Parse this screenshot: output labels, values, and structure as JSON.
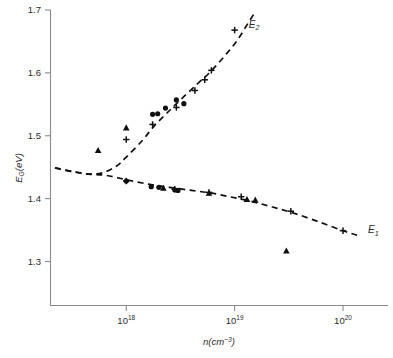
{
  "chart_data": {
    "type": "scatter",
    "title": "",
    "xlabel": "n(cm−3)",
    "xlabel_base": "n(cm",
    "xlabel_exp": "−3",
    "xlabel_close": ")",
    "ylabel": "E_G(eV)",
    "ylabel_base": "E",
    "ylabel_sub": "G",
    "ylabel_unit": "(eV)",
    "xscale": "log",
    "yscale": "linear",
    "xlim": [
      2e+17,
      2.6e+20
    ],
    "ylim": [
      1.23,
      1.7
    ],
    "grid": false,
    "legend_position": "inline-annotation",
    "xticks": [
      {
        "value": 1e+18,
        "label": "10",
        "exponent": "18"
      },
      {
        "value": 1e+19,
        "label": "10",
        "exponent": "19"
      },
      {
        "value": 1e+20,
        "label": "10",
        "exponent": "20"
      }
    ],
    "yticks": [
      {
        "value": 1.7,
        "label": "1.7"
      },
      {
        "value": 1.6,
        "label": "1.6"
      },
      {
        "value": 1.5,
        "label": "1.5"
      },
      {
        "value": 1.4,
        "label": "1.4"
      },
      {
        "value": 1.3,
        "label": "1.3"
      }
    ],
    "annotations": [
      {
        "text": "E",
        "sub": "2",
        "x": 1.35e+19,
        "y": 1.672,
        "name": "curve-label-e2"
      },
      {
        "text": "E",
        "sub": "1",
        "x": 1.7e+20,
        "y": 1.345,
        "name": "curve-label-e1"
      }
    ],
    "series": [
      {
        "name": "E2",
        "kind": "fit-curve",
        "style": "dashed",
        "points": [
          {
            "x": 2.2e+17,
            "y": 1.449
          },
          {
            "x": 3.2e+17,
            "y": 1.443
          },
          {
            "x": 4.5e+17,
            "y": 1.439
          },
          {
            "x": 6e+17,
            "y": 1.441
          },
          {
            "x": 8e+17,
            "y": 1.451
          },
          {
            "x": 1e+18,
            "y": 1.466
          },
          {
            "x": 1.4e+18,
            "y": 1.492
          },
          {
            "x": 1.8e+18,
            "y": 1.515
          },
          {
            "x": 2.4e+18,
            "y": 1.537
          },
          {
            "x": 3.2e+18,
            "y": 1.558
          },
          {
            "x": 4.5e+18,
            "y": 1.582
          },
          {
            "x": 6e+18,
            "y": 1.602
          },
          {
            "x": 8e+18,
            "y": 1.626
          },
          {
            "x": 1.05e+19,
            "y": 1.651
          },
          {
            "x": 1.35e+19,
            "y": 1.681
          },
          {
            "x": 1.55e+19,
            "y": 1.697
          }
        ]
      },
      {
        "name": "E1",
        "kind": "fit-curve",
        "style": "dashed",
        "points": [
          {
            "x": 2.2e+17,
            "y": 1.449
          },
          {
            "x": 3.2e+17,
            "y": 1.443
          },
          {
            "x": 4.5e+17,
            "y": 1.439
          },
          {
            "x": 6.5e+17,
            "y": 1.437
          },
          {
            "x": 1e+18,
            "y": 1.43
          },
          {
            "x": 1.6e+18,
            "y": 1.423
          },
          {
            "x": 2.5e+18,
            "y": 1.418
          },
          {
            "x": 4e+18,
            "y": 1.413
          },
          {
            "x": 6e+18,
            "y": 1.409
          },
          {
            "x": 9e+18,
            "y": 1.403
          },
          {
            "x": 1.4e+19,
            "y": 1.396
          },
          {
            "x": 2.2e+19,
            "y": 1.387
          },
          {
            "x": 3.5e+19,
            "y": 1.377
          },
          {
            "x": 6e+19,
            "y": 1.363
          },
          {
            "x": 1e+20,
            "y": 1.349
          },
          {
            "x": 1.45e+20,
            "y": 1.34
          }
        ]
      },
      {
        "name": "E2 data (circles)",
        "kind": "scatter",
        "marker": "circle",
        "points": [
          {
            "x": 1.75e+18,
            "y": 1.534
          },
          {
            "x": 1.95e+18,
            "y": 1.535
          },
          {
            "x": 2.3e+18,
            "y": 1.544
          },
          {
            "x": 2.9e+18,
            "y": 1.557
          },
          {
            "x": 3.4e+18,
            "y": 1.551
          }
        ]
      },
      {
        "name": "E2 data (triangles)",
        "kind": "scatter",
        "marker": "triangle",
        "points": [
          {
            "x": 5.5e+17,
            "y": 1.477
          },
          {
            "x": 1e+18,
            "y": 1.513
          }
        ]
      },
      {
        "name": "E2 data (plus)",
        "kind": "scatter",
        "marker": "plus",
        "points": [
          {
            "x": 1e+18,
            "y": 1.494
          },
          {
            "x": 1.75e+18,
            "y": 1.518
          },
          {
            "x": 2.9e+18,
            "y": 1.545
          },
          {
            "x": 4.3e+18,
            "y": 1.572
          },
          {
            "x": 5.3e+18,
            "y": 1.589
          },
          {
            "x": 6.1e+18,
            "y": 1.604
          },
          {
            "x": 1e+19,
            "y": 1.668
          }
        ]
      },
      {
        "name": "E1 data (circles)",
        "kind": "scatter",
        "marker": "circle",
        "points": [
          {
            "x": 1e+18,
            "y": 1.428
          },
          {
            "x": 1.7e+18,
            "y": 1.419
          },
          {
            "x": 2e+18,
            "y": 1.418
          },
          {
            "x": 2.8e+18,
            "y": 1.414
          },
          {
            "x": 3e+18,
            "y": 1.413
          }
        ]
      },
      {
        "name": "E1 data (triangles)",
        "kind": "scatter",
        "marker": "triangle",
        "points": [
          {
            "x": 2.2e+18,
            "y": 1.417
          },
          {
            "x": 5.8e+18,
            "y": 1.409
          },
          {
            "x": 1.3e+19,
            "y": 1.399
          },
          {
            "x": 1.55e+19,
            "y": 1.398
          },
          {
            "x": 3e+19,
            "y": 1.317
          }
        ]
      },
      {
        "name": "E1 data (plus)",
        "kind": "scatter",
        "marker": "plus",
        "points": [
          {
            "x": 1e+18,
            "y": 1.428
          },
          {
            "x": 2.8e+18,
            "y": 1.415
          },
          {
            "x": 5.8e+18,
            "y": 1.41
          },
          {
            "x": 1.15e+19,
            "y": 1.403
          },
          {
            "x": 3.3e+19,
            "y": 1.38
          },
          {
            "x": 1e+20,
            "y": 1.349
          }
        ]
      }
    ]
  },
  "figure": {
    "background_color": "#ffffff",
    "ink_color": "#101010",
    "axis_color": "#8a8a8a"
  }
}
